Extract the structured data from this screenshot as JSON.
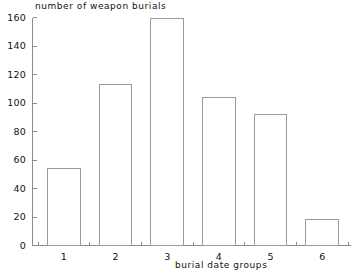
{
  "chart_data": {
    "type": "bar",
    "title": "number of weapon burials",
    "xlabel": "burial date groups",
    "ylabel": "",
    "categories": [
      "1",
      "2",
      "3",
      "4",
      "5",
      "6"
    ],
    "values": [
      54,
      113,
      159,
      104,
      92,
      18
    ],
    "ylim": [
      0,
      160
    ],
    "yticks": [
      0,
      20,
      40,
      60,
      80,
      100,
      120,
      140,
      160
    ],
    "ytick_labels": [
      "0",
      "20",
      "40",
      "60",
      "80",
      "100",
      "120",
      "140",
      "160"
    ],
    "grid": false,
    "legend": null,
    "bar_style": "outline",
    "bar_fill_color": "#ffffff",
    "bar_edge_color": "#9a9a9a",
    "axis_color": "#8c8c8c",
    "text_color": "#111111",
    "background_color": "#ffffff"
  },
  "axis": {
    "y_title": "number of weapon burials",
    "x_title": "burial date groups"
  }
}
